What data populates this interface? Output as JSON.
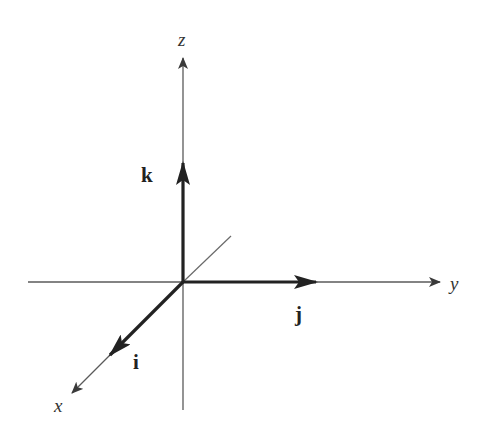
{
  "diagram": {
    "origin": {
      "x": 183,
      "y": 282
    },
    "colors": {
      "axis": "#5a5a5a",
      "vector": "#222222",
      "label": "#333333",
      "background": "#ffffff"
    },
    "axes": [
      {
        "name": "x",
        "label": "x",
        "from": [
          183,
          282
        ],
        "to": [
          72,
          393
        ],
        "label_pos": [
          57,
          412
        ]
      },
      {
        "name": "y",
        "label": "y",
        "from": [
          28,
          282
        ],
        "to": [
          440,
          282
        ],
        "label_pos": [
          450,
          290
        ]
      },
      {
        "name": "z",
        "label": "z",
        "from": [
          183,
          410
        ],
        "to": [
          183,
          58
        ],
        "label_pos": [
          178,
          46
        ]
      }
    ],
    "back_segment": {
      "from": [
        183,
        282
      ],
      "to": [
        231,
        236
      ]
    },
    "vectors": [
      {
        "name": "i",
        "label": "i",
        "to": [
          110,
          355
        ],
        "label_pos": [
          133,
          368
        ]
      },
      {
        "name": "j",
        "label": "j",
        "to": [
          316,
          282
        ],
        "label_pos": [
          293,
          321
        ]
      },
      {
        "name": "k",
        "label": "k",
        "to": [
          183,
          163
        ],
        "label_pos": [
          142,
          182
        ]
      }
    ]
  }
}
